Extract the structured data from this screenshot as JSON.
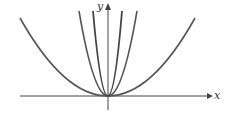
{
  "diagram": {
    "x_label": "x",
    "y_label": "y",
    "curves": [
      {
        "name": "wide-parabola",
        "apex": [
          108,
          96
        ],
        "through": [
          20,
          18
        ]
      },
      {
        "name": "medium-parabola",
        "apex": [
          108,
          96
        ],
        "through": [
          79,
          11
        ]
      },
      {
        "name": "narrow-parabola",
        "apex": [
          108,
          96
        ],
        "through": [
          93,
          11
        ]
      }
    ],
    "colors": {
      "curve": "#555555",
      "axis": "#444444"
    }
  }
}
